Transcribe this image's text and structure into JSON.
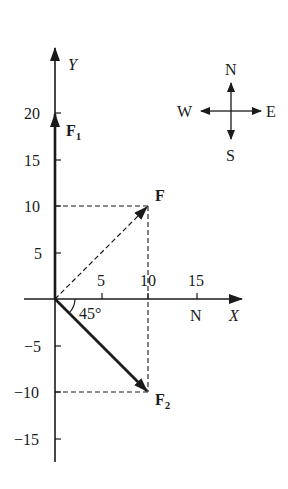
{
  "axes": {
    "x_label": "X",
    "y_label": "Y",
    "x_unit": "N",
    "x_ticks": [
      {
        "value": 5,
        "label": "5"
      },
      {
        "value": 10,
        "label": "10"
      },
      {
        "value": 15,
        "label": "15"
      }
    ],
    "y_ticks": [
      {
        "value": 20,
        "label": "20"
      },
      {
        "value": 15,
        "label": "15"
      },
      {
        "value": 10,
        "label": "10"
      },
      {
        "value": 5,
        "label": "5"
      },
      {
        "value": -5,
        "label": "−5"
      },
      {
        "value": -10,
        "label": "−10"
      },
      {
        "value": -15,
        "label": "−15"
      }
    ]
  },
  "vectors": {
    "F1": {
      "label": "F",
      "subscript": "1",
      "x": 0,
      "y": 20
    },
    "F": {
      "label": "F",
      "x": 10,
      "y": 10
    },
    "F2": {
      "label": "F",
      "subscript": "2",
      "x": 10,
      "y": -10
    }
  },
  "angle_label": "45°",
  "compass": {
    "N": "N",
    "S": "S",
    "E": "E",
    "W": "W"
  },
  "colors": {
    "ink": "#1a1a1a",
    "background": "#ffffff"
  }
}
